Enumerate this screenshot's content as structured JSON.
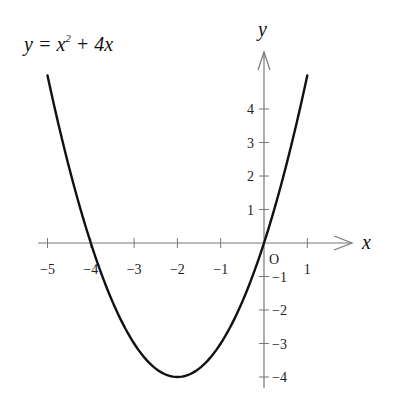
{
  "chart_data": {
    "type": "line",
    "title_parts": {
      "lhs": "y",
      "eq": " = ",
      "x": "x",
      "exp": "2",
      "rest": " + 4",
      "x2": "x"
    },
    "xlabel": "x",
    "ylabel": "y",
    "origin_label": "O",
    "xlim": [
      -5,
      1
    ],
    "ylim": [
      -4,
      5
    ],
    "x_ticks": [
      -5,
      -4,
      -3,
      -2,
      -1,
      1
    ],
    "x_tick_labels": [
      "−5",
      "−4",
      "−3",
      "−2",
      "−1",
      "1"
    ],
    "y_ticks": [
      -4,
      -3,
      -2,
      -1,
      1,
      2,
      3,
      4
    ],
    "y_tick_labels": [
      "−4",
      "−3",
      "−2",
      "−1",
      "1",
      "2",
      "3",
      "4"
    ],
    "grid": false,
    "series": [
      {
        "name": "y = x^2 + 4x",
        "x": [
          -5,
          -4.5,
          -4,
          -3.5,
          -3,
          -2.5,
          -2,
          -1.5,
          -1,
          -0.5,
          0,
          0.5,
          1
        ],
        "values": [
          5,
          2.25,
          0,
          -1.75,
          -3,
          -3.75,
          -4,
          -3.75,
          -3,
          -1.75,
          0,
          2.25,
          5
        ],
        "color": "#111111"
      }
    ],
    "key_points": {
      "vertex": [
        -2,
        -4
      ],
      "roots": [
        -4,
        0
      ]
    }
  }
}
